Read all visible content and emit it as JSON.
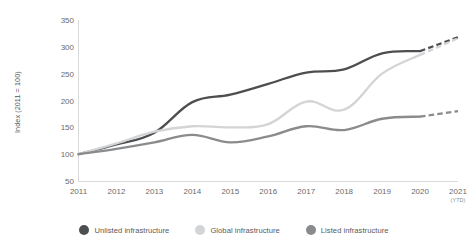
{
  "chart_data": {
    "type": "line",
    "title": "",
    "subtitle": "",
    "xlabel": "",
    "ylabel": "Index (2011 = 100)",
    "categories": [
      "2011",
      "2012",
      "2013",
      "2014",
      "2015",
      "2016",
      "2017",
      "2018",
      "2019",
      "2020",
      "2021"
    ],
    "x_tick_sublabels": [
      "",
      "",
      "",
      "",
      "",
      "",
      "",
      "",
      "",
      "",
      "(YTD)"
    ],
    "ylim": [
      50,
      350
    ],
    "yticks": [
      50,
      100,
      150,
      200,
      250,
      300,
      350
    ],
    "grid": false,
    "legend_position": "bottom",
    "dashed_final_segment": true,
    "series": [
      {
        "name": "Unlisted infrastructure",
        "color": "#4d4e50",
        "values": [
          100,
          118,
          140,
          197,
          211,
          231,
          252,
          258,
          288,
          292,
          318
        ]
      },
      {
        "name": "Global infrastructure",
        "color": "#d3d4d6",
        "values": [
          100,
          120,
          142,
          152,
          150,
          156,
          198,
          183,
          250,
          285,
          316
        ]
      },
      {
        "name": "Listed infrastructure",
        "color": "#8a8b8d",
        "values": [
          100,
          110,
          122,
          136,
          122,
          133,
          152,
          145,
          166,
          170,
          180
        ]
      }
    ]
  },
  "axis": {
    "y_title": "Index (2011 = 100)",
    "y_tick_labels": [
      "350",
      "300",
      "250",
      "200",
      "150",
      "100",
      "50"
    ]
  },
  "legend": {
    "items": [
      {
        "label": "Unlisted infrastructure",
        "color": "#4d4e50"
      },
      {
        "label": "Global infrastructure",
        "color": "#d3d4d6"
      },
      {
        "label": "Listed infrastructure",
        "color": "#8a8b8d"
      }
    ]
  },
  "colors": {
    "axis_line": "#d8d9da",
    "tick_text": "#6a6b6d",
    "label_text": "#58595b",
    "background": "#ffffff"
  }
}
